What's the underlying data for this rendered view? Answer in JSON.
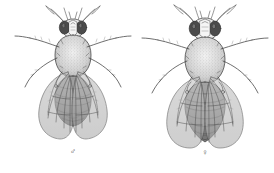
{
  "plate": {
    "background_color": "#ffffff",
    "ink_color": "#4a4a4a",
    "line_color": "#3f3f3f",
    "wing_fill": "#b9b9b9",
    "body_fill": "#9a9a9a",
    "eye_fill": "#4b4b4b",
    "thorax_fill": "#dcdcdc",
    "caption": ""
  },
  "figures": [
    {
      "id": "male",
      "label": "♂",
      "label_name": "male-symbol",
      "common_name": "",
      "view": "dorsal",
      "relative_size": "smaller",
      "abdomen_shape": "rounded, dark posterior",
      "wing_span_px": 122,
      "body_length_px": 118
    },
    {
      "id": "female",
      "label": "♀",
      "label_name": "female-symbol",
      "common_name": "",
      "view": "dorsal",
      "relative_size": "larger",
      "abdomen_shape": "tapered, banded",
      "wing_span_px": 132,
      "body_length_px": 134
    }
  ]
}
